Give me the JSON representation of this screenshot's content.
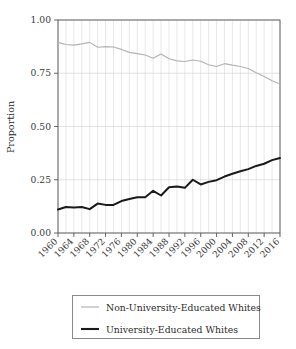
{
  "chart_data": {
    "type": "line",
    "title": "",
    "xlabel": "",
    "ylabel": "Proportion",
    "ylim": [
      0.0,
      1.0
    ],
    "xlim": [
      1960,
      2016
    ],
    "grid": true,
    "legend_position": "below-axes",
    "ytick_labels": [
      "0.00",
      "0.25",
      "0.50",
      "0.75",
      "1.00"
    ],
    "ytick_values": [
      0.0,
      0.25,
      0.5,
      0.75,
      1.0
    ],
    "xtick_labels": [
      "1960",
      "1964",
      "1968",
      "1972",
      "1976",
      "1980",
      "1984",
      "1988",
      "1992",
      "1996",
      "2000",
      "2004",
      "2008",
      "2012",
      "2016"
    ],
    "xtick_values": [
      1960,
      1964,
      1968,
      1972,
      1976,
      1980,
      1984,
      1988,
      1992,
      1996,
      2000,
      2004,
      2008,
      2012,
      2016
    ],
    "x": [
      1960,
      1962,
      1964,
      1966,
      1968,
      1970,
      1972,
      1974,
      1976,
      1978,
      1980,
      1982,
      1984,
      1986,
      1988,
      1990,
      1992,
      1994,
      1996,
      1998,
      2000,
      2002,
      2004,
      2006,
      2008,
      2010,
      2012,
      2014,
      2016
    ],
    "series": [
      {
        "name": "Non-University-Educated Whites",
        "color": "#b3b3b3",
        "width": 1.1,
        "values": [
          0.895,
          0.885,
          0.882,
          0.888,
          0.895,
          0.872,
          0.875,
          0.873,
          0.862,
          0.848,
          0.842,
          0.836,
          0.82,
          0.84,
          0.818,
          0.808,
          0.805,
          0.812,
          0.806,
          0.79,
          0.782,
          0.795,
          0.788,
          0.782,
          0.772,
          0.752,
          0.735,
          0.715,
          0.7
        ]
      },
      {
        "name": "University-Educated Whites",
        "color": "#1a1a1a",
        "width": 2.0,
        "values": [
          0.11,
          0.122,
          0.12,
          0.122,
          0.112,
          0.138,
          0.132,
          0.132,
          0.15,
          0.16,
          0.168,
          0.168,
          0.198,
          0.176,
          0.215,
          0.218,
          0.212,
          0.25,
          0.228,
          0.24,
          0.248,
          0.265,
          0.278,
          0.29,
          0.3,
          0.315,
          0.325,
          0.342,
          0.352
        ]
      }
    ]
  },
  "legend": {
    "entries": [
      {
        "label": "Non-University-Educated Whites"
      },
      {
        "label": "University-Educated Whites"
      }
    ]
  }
}
